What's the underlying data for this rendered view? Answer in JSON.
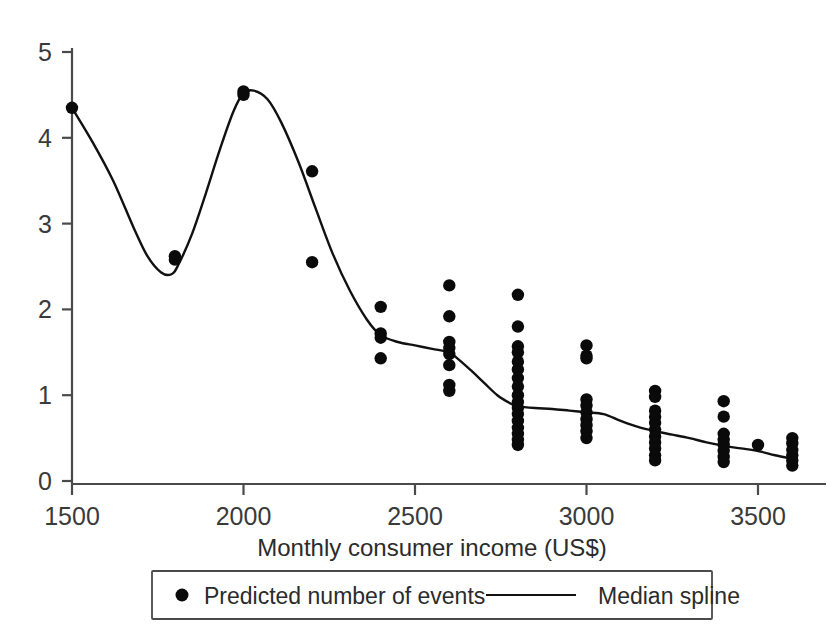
{
  "chart_data": {
    "type": "scatter",
    "title": "",
    "xlabel": "Monthly consumer income (US$)",
    "ylabel": "",
    "xlim": [
      1430,
      3640
    ],
    "ylim": [
      0,
      5.25
    ],
    "grid": false,
    "legend_position": "bottom",
    "x_ticks": [
      1500,
      2000,
      2500,
      3000,
      3500
    ],
    "x_tick_labels": [
      "1500",
      "2000",
      "2500",
      "3000",
      "3500"
    ],
    "y_ticks": [
      0,
      1,
      2,
      3,
      4,
      5
    ],
    "y_tick_labels": [
      "0",
      "1",
      "2",
      "3",
      "4",
      "5"
    ],
    "series": [
      {
        "name": "Predicted number of events",
        "type": "scatter",
        "marker": "circle",
        "color": "#0a0a0a",
        "points": [
          {
            "x": 1500,
            "y": 4.35
          },
          {
            "x": 1800,
            "y": 2.62
          },
          {
            "x": 1800,
            "y": 2.58
          },
          {
            "x": 2000,
            "y": 4.54
          },
          {
            "x": 2000,
            "y": 4.5
          },
          {
            "x": 2200,
            "y": 3.61
          },
          {
            "x": 2200,
            "y": 2.55
          },
          {
            "x": 2400,
            "y": 2.03
          },
          {
            "x": 2400,
            "y": 1.72
          },
          {
            "x": 2400,
            "y": 1.67
          },
          {
            "x": 2400,
            "y": 1.43
          },
          {
            "x": 2600,
            "y": 2.28
          },
          {
            "x": 2600,
            "y": 1.92
          },
          {
            "x": 2600,
            "y": 1.62
          },
          {
            "x": 2600,
            "y": 1.55
          },
          {
            "x": 2600,
            "y": 1.48
          },
          {
            "x": 2600,
            "y": 1.35
          },
          {
            "x": 2600,
            "y": 1.12
          },
          {
            "x": 2600,
            "y": 1.05
          },
          {
            "x": 2800,
            "y": 2.17
          },
          {
            "x": 2800,
            "y": 1.8
          },
          {
            "x": 2800,
            "y": 1.57
          },
          {
            "x": 2800,
            "y": 1.5
          },
          {
            "x": 2800,
            "y": 1.39
          },
          {
            "x": 2800,
            "y": 1.3
          },
          {
            "x": 2800,
            "y": 1.2
          },
          {
            "x": 2800,
            "y": 1.1
          },
          {
            "x": 2800,
            "y": 1.0
          },
          {
            "x": 2800,
            "y": 0.92
          },
          {
            "x": 2800,
            "y": 0.85
          },
          {
            "x": 2800,
            "y": 0.78
          },
          {
            "x": 2800,
            "y": 0.7
          },
          {
            "x": 2800,
            "y": 0.62
          },
          {
            "x": 2800,
            "y": 0.55
          },
          {
            "x": 2800,
            "y": 0.48
          },
          {
            "x": 2800,
            "y": 0.42
          },
          {
            "x": 3000,
            "y": 1.58
          },
          {
            "x": 3000,
            "y": 1.46
          },
          {
            "x": 3000,
            "y": 1.43
          },
          {
            "x": 3000,
            "y": 0.95
          },
          {
            "x": 3000,
            "y": 0.88
          },
          {
            "x": 3000,
            "y": 0.8
          },
          {
            "x": 3000,
            "y": 0.72
          },
          {
            "x": 3000,
            "y": 0.65
          },
          {
            "x": 3000,
            "y": 0.58
          },
          {
            "x": 3000,
            "y": 0.5
          },
          {
            "x": 3200,
            "y": 1.05
          },
          {
            "x": 3200,
            "y": 0.98
          },
          {
            "x": 3200,
            "y": 0.82
          },
          {
            "x": 3200,
            "y": 0.75
          },
          {
            "x": 3200,
            "y": 0.68
          },
          {
            "x": 3200,
            "y": 0.6
          },
          {
            "x": 3200,
            "y": 0.52
          },
          {
            "x": 3200,
            "y": 0.45
          },
          {
            "x": 3200,
            "y": 0.38
          },
          {
            "x": 3200,
            "y": 0.3
          },
          {
            "x": 3200,
            "y": 0.24
          },
          {
            "x": 3400,
            "y": 0.93
          },
          {
            "x": 3400,
            "y": 0.75
          },
          {
            "x": 3400,
            "y": 0.55
          },
          {
            "x": 3400,
            "y": 0.48
          },
          {
            "x": 3400,
            "y": 0.42
          },
          {
            "x": 3400,
            "y": 0.35
          },
          {
            "x": 3400,
            "y": 0.28
          },
          {
            "x": 3400,
            "y": 0.22
          },
          {
            "x": 3500,
            "y": 0.42
          },
          {
            "x": 3600,
            "y": 0.5
          },
          {
            "x": 3600,
            "y": 0.44
          },
          {
            "x": 3600,
            "y": 0.36
          },
          {
            "x": 3600,
            "y": 0.3
          },
          {
            "x": 3600,
            "y": 0.24
          },
          {
            "x": 3600,
            "y": 0.18
          }
        ]
      },
      {
        "name": "Median spline",
        "type": "line",
        "color": "#111111",
        "points": [
          {
            "x": 1500,
            "y": 4.35
          },
          {
            "x": 1560,
            "y": 3.95
          },
          {
            "x": 1620,
            "y": 3.5
          },
          {
            "x": 1680,
            "y": 2.95
          },
          {
            "x": 1720,
            "y": 2.62
          },
          {
            "x": 1760,
            "y": 2.43
          },
          {
            "x": 1790,
            "y": 2.41
          },
          {
            "x": 1810,
            "y": 2.52
          },
          {
            "x": 1850,
            "y": 2.88
          },
          {
            "x": 1890,
            "y": 3.35
          },
          {
            "x": 1930,
            "y": 3.85
          },
          {
            "x": 1970,
            "y": 4.3
          },
          {
            "x": 2000,
            "y": 4.52
          },
          {
            "x": 2030,
            "y": 4.55
          },
          {
            "x": 2070,
            "y": 4.45
          },
          {
            "x": 2110,
            "y": 4.18
          },
          {
            "x": 2160,
            "y": 3.72
          },
          {
            "x": 2210,
            "y": 3.18
          },
          {
            "x": 2260,
            "y": 2.65
          },
          {
            "x": 2310,
            "y": 2.22
          },
          {
            "x": 2360,
            "y": 1.88
          },
          {
            "x": 2400,
            "y": 1.7
          },
          {
            "x": 2450,
            "y": 1.62
          },
          {
            "x": 2500,
            "y": 1.58
          },
          {
            "x": 2550,
            "y": 1.54
          },
          {
            "x": 2600,
            "y": 1.5
          },
          {
            "x": 2620,
            "y": 1.44
          },
          {
            "x": 2660,
            "y": 1.3
          },
          {
            "x": 2700,
            "y": 1.15
          },
          {
            "x": 2740,
            "y": 1.0
          },
          {
            "x": 2780,
            "y": 0.9
          },
          {
            "x": 2800,
            "y": 0.87
          },
          {
            "x": 2850,
            "y": 0.85
          },
          {
            "x": 2900,
            "y": 0.84
          },
          {
            "x": 2950,
            "y": 0.82
          },
          {
            "x": 3000,
            "y": 0.8
          },
          {
            "x": 3050,
            "y": 0.78
          },
          {
            "x": 3100,
            "y": 0.7
          },
          {
            "x": 3150,
            "y": 0.63
          },
          {
            "x": 3200,
            "y": 0.58
          },
          {
            "x": 3250,
            "y": 0.54
          },
          {
            "x": 3300,
            "y": 0.5
          },
          {
            "x": 3350,
            "y": 0.45
          },
          {
            "x": 3400,
            "y": 0.41
          },
          {
            "x": 3450,
            "y": 0.38
          },
          {
            "x": 3500,
            "y": 0.35
          },
          {
            "x": 3550,
            "y": 0.3
          },
          {
            "x": 3600,
            "y": 0.26
          }
        ]
      }
    ]
  },
  "legend": {
    "entries": [
      {
        "label": "Predicted number of events",
        "marker": "dot-marker"
      },
      {
        "label": "Median spline",
        "marker": "line-marker"
      }
    ]
  }
}
